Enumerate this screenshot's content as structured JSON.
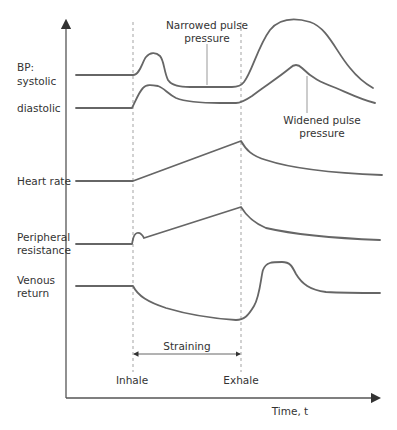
{
  "axes": {
    "x_label": "Time, t",
    "y_label": ""
  },
  "row_labels": {
    "bp_line1": "BP:",
    "bp_line2": "systolic",
    "diastolic": "diastolic",
    "heart_rate": "Heart rate",
    "peripheral_line1": "Peripheral",
    "peripheral_line2": "resistance",
    "venous_line1": "Venous",
    "venous_line2": "return"
  },
  "annotations": {
    "narrowed_line1": "Narrowed pulse",
    "narrowed_line2": "pressure",
    "widened_line1": "Widened pulse",
    "widened_line2": "pressure",
    "straining": "Straining",
    "inhale": "Inhale",
    "exhale": "Exhale"
  },
  "colors": {
    "curve": "#666666",
    "axis": "#555555",
    "dashed_marker": "#999999",
    "text": "#333333"
  }
}
